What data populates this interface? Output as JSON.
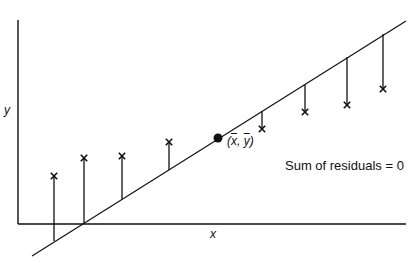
{
  "diagram": {
    "axes": {
      "x_label": "x",
      "y_label": "y",
      "origin": [
        18,
        224
      ],
      "x_axis_end": 406,
      "y_axis_top": 20
    },
    "regression_line": {
      "start": [
        32,
        256
      ],
      "end": [
        406,
        21
      ]
    },
    "mean_point": {
      "label_x": "x",
      "label_y": "y",
      "label_sep": ", ",
      "pos": [
        218,
        138
      ]
    },
    "annotation": "Sum of residuals = 0",
    "points": [
      {
        "x": 54,
        "y_obs": 176,
        "y_fit": 241,
        "residual_sign": "positive"
      },
      {
        "x": 84,
        "y_obs": 158,
        "y_fit": 223,
        "residual_sign": "positive"
      },
      {
        "x": 122,
        "y_obs": 156,
        "y_fit": 199,
        "residual_sign": "positive"
      },
      {
        "x": 169,
        "y_obs": 142,
        "y_fit": 170,
        "residual_sign": "positive"
      },
      {
        "x": 262,
        "y_obs": 129,
        "y_fit": 111,
        "residual_sign": "negative"
      },
      {
        "x": 305,
        "y_obs": 112,
        "y_fit": 85,
        "residual_sign": "negative"
      },
      {
        "x": 347,
        "y_obs": 105,
        "y_fit": 57,
        "residual_sign": "negative"
      },
      {
        "x": 383,
        "y_obs": 89,
        "y_fit": 34,
        "residual_sign": "negative"
      }
    ],
    "colors": {
      "ink": "#111111",
      "background": "#ffffff"
    }
  }
}
